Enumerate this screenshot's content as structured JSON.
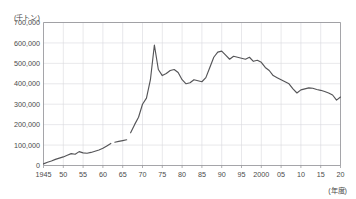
{
  "chart_data": {
    "type": "line",
    "title": "",
    "unit_label": "(千トン)",
    "xlabel": "(年度)",
    "ylabel": "",
    "ylim": [
      0,
      700000
    ],
    "xlim": [
      1945,
      2020
    ],
    "grid": true,
    "legend": "none",
    "y_ticks": [
      "0",
      "100,000",
      "200,000",
      "300,000",
      "400,000",
      "500,000",
      "600,000",
      "700,000"
    ],
    "y_tick_values": [
      0,
      100000,
      200000,
      300000,
      400000,
      500000,
      600000,
      700000
    ],
    "x_ticks": [
      "1945",
      "50",
      "55",
      "60",
      "65",
      "70",
      "75",
      "80",
      "85",
      "90",
      "95",
      "2000",
      "05",
      "10",
      "15",
      "20"
    ],
    "x_tick_values": [
      1945,
      1950,
      1955,
      1960,
      1965,
      1970,
      1975,
      1980,
      1985,
      1990,
      1995,
      2000,
      2005,
      2010,
      2015,
      2020
    ],
    "line_color": "#555558",
    "series": [
      {
        "name": "segment-1",
        "x": [
          1945,
          1946,
          1947,
          1948,
          1949,
          1950,
          1951,
          1952,
          1953,
          1954,
          1955,
          1956,
          1957,
          1958,
          1959,
          1960,
          1961,
          1962
        ],
        "values": [
          8000,
          16000,
          22000,
          30000,
          36000,
          42000,
          50000,
          58000,
          55000,
          68000,
          62000,
          60000,
          64000,
          70000,
          76000,
          84000,
          96000,
          108000
        ]
      },
      {
        "name": "segment-2",
        "x": [
          1963,
          1964,
          1965,
          1966
        ],
        "values": [
          114000,
          118000,
          122000,
          126000
        ]
      },
      {
        "name": "segment-3",
        "x": [
          1967,
          1968,
          1969,
          1970,
          1971,
          1972,
          1973,
          1974,
          1975,
          1976,
          1977,
          1978,
          1979,
          1980,
          1981,
          1982,
          1983,
          1984,
          1985,
          1986,
          1987,
          1988,
          1989,
          1990,
          1991,
          1992,
          1993,
          1994,
          1995,
          1996,
          1997,
          1998,
          1999,
          2000,
          2001,
          2002,
          2003,
          2004,
          2005,
          2006,
          2007,
          2008,
          2009,
          2010,
          2011,
          2012,
          2013,
          2014,
          2015,
          2016,
          2017,
          2018,
          2019,
          2020
        ],
        "values": [
          160000,
          200000,
          236000,
          300000,
          330000,
          420000,
          590000,
          470000,
          440000,
          450000,
          465000,
          470000,
          455000,
          420000,
          400000,
          405000,
          420000,
          415000,
          410000,
          430000,
          480000,
          530000,
          555000,
          560000,
          540000,
          520000,
          535000,
          530000,
          525000,
          520000,
          530000,
          510000,
          515000,
          505000,
          480000,
          465000,
          440000,
          430000,
          420000,
          410000,
          400000,
          375000,
          355000,
          370000,
          375000,
          380000,
          378000,
          372000,
          368000,
          362000,
          355000,
          345000,
          320000,
          335000
        ]
      }
    ]
  }
}
